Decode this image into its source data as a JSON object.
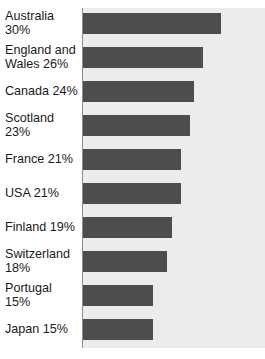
{
  "figure": {
    "cutoff_header": "",
    "background_color": "#ffffff",
    "plot_background_color": "#ececec",
    "bar_color": "#4d4d4d",
    "axis_color": "#8e8e8e"
  },
  "chart_data": {
    "type": "bar",
    "orientation": "horizontal",
    "title": "",
    "subtitle": "",
    "xlabel": "",
    "ylabel": "",
    "grid": false,
    "legend": null,
    "xlim": [
      0,
      39.5
    ],
    "value_unit": "%",
    "categories": [
      "Australia",
      "England and Wales",
      "Canada",
      "Scotland",
      "France",
      "USA",
      "Finland",
      "Switzerland",
      "Portugal",
      "Japan"
    ],
    "values": [
      30,
      26,
      24,
      23,
      21,
      21,
      19,
      18,
      15,
      15
    ],
    "bars": [
      {
        "label": "Australia 30%",
        "label_lines": "Australia 30%",
        "category": "Australia",
        "value": 30,
        "bar_width_px": 138
      },
      {
        "label": "England and Wales 26%",
        "label_lines": "England and\nWales 26%",
        "category": "England and Wales",
        "value": 26,
        "bar_width_px": 120
      },
      {
        "label": "Canada 24%",
        "label_lines": "Canada 24%",
        "category": "Canada",
        "value": 24,
        "bar_width_px": 111
      },
      {
        "label": "Scotland 23%",
        "label_lines": "Scotland 23%",
        "category": "Scotland",
        "value": 23,
        "bar_width_px": 107
      },
      {
        "label": "France 21%",
        "label_lines": "France 21%",
        "category": "France",
        "value": 21,
        "bar_width_px": 98
      },
      {
        "label": "USA 21%",
        "label_lines": "USA 21%",
        "category": "USA",
        "value": 21,
        "bar_width_px": 98
      },
      {
        "label": "Finland 19%",
        "label_lines": "Finland 19%",
        "category": "Finland",
        "value": 19,
        "bar_width_px": 89
      },
      {
        "label": "Switzerland 18%",
        "label_lines": "Switzerland\n18%",
        "category": "Switzerland",
        "value": 18,
        "bar_width_px": 84
      },
      {
        "label": "Portugal 15%",
        "label_lines": "Portugal 15%",
        "category": "Portugal",
        "value": 15,
        "bar_width_px": 70
      },
      {
        "label": "Japan 15%",
        "label_lines": "Japan 15%",
        "category": "Japan",
        "value": 15,
        "bar_width_px": 70
      }
    ]
  }
}
